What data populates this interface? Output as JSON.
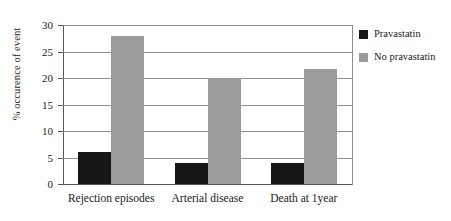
{
  "chart_data": {
    "type": "bar",
    "title": "",
    "xlabel": "",
    "ylabel": "% occurence of event",
    "categories": [
      "Rejection episodes",
      "Arterial disease",
      "Death at 1year"
    ],
    "series": [
      {
        "name": "Pravastatin",
        "color": "#161616",
        "values": [
          6,
          4,
          4
        ]
      },
      {
        "name": "No pravastatin",
        "color": "#9b9b9b",
        "values": [
          28,
          20,
          21.7
        ]
      }
    ],
    "ylim": [
      0,
      30
    ],
    "yticks": [
      0,
      5,
      10,
      15,
      20,
      25,
      30
    ],
    "ytick_labels": [
      "0",
      "5",
      "10",
      "15",
      "20",
      "25",
      "30"
    ],
    "grid": true,
    "legend_position": "right"
  },
  "legend": {
    "items": [
      {
        "label": "Pravastatin",
        "color": "#161616"
      },
      {
        "label": "No pravastatin",
        "color": "#9b9b9b"
      }
    ]
  }
}
